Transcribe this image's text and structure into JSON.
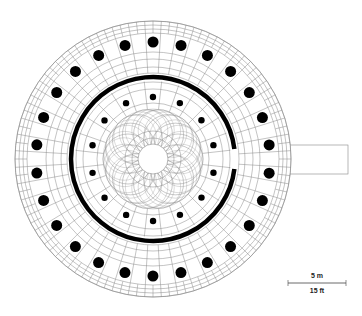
{
  "diagram": {
    "type": "architectural-floor-plan",
    "colors": {
      "background": "#ffffff",
      "lines": "#888888",
      "solid": "#000000"
    },
    "geometry": {
      "center": [
        153,
        159
      ],
      "outer_radius": 138,
      "outer_rings": [
        138,
        134,
        130,
        126
      ],
      "outer_colonnade": {
        "count": 26,
        "radius": 117,
        "column_radius": 5.5,
        "start_angle_deg": 6.9
      },
      "cella_wall": {
        "radius": 82,
        "thickness": 4.5,
        "door_gap_deg": 7
      },
      "inner_colonnade": {
        "count": 14,
        "radius": 62,
        "column_radius": 3.2,
        "start_angle_deg": 12.9
      },
      "floor_rosette": {
        "radius": 50,
        "petals": 14
      },
      "center_void_radius": 15,
      "center_ring_radius": 21,
      "ramp": {
        "x": 273,
        "y": 145,
        "width": 75,
        "height": 29
      }
    },
    "scale_bar": {
      "metric_label": "5 m",
      "imperial_label": "15 ft",
      "x1": 288,
      "x2": 346,
      "y": 283
    }
  }
}
